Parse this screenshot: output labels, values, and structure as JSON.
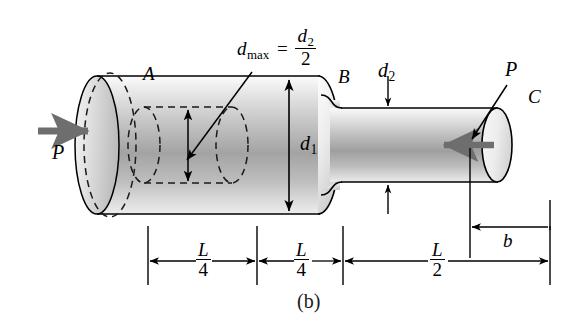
{
  "figure": {
    "caption": "(b)",
    "colors": {
      "line": "#000000",
      "shaft_light": "#f2f2f2",
      "shaft_mid": "#c9c9c9",
      "shaft_dark": "#8f8f8f",
      "end_face": "#e8e8e8",
      "load_arrow": "#6e6e6e",
      "background": "#ffffff"
    }
  },
  "labels": {
    "point_a": "A",
    "point_b": "B",
    "point_c": "C",
    "load_left": "P",
    "load_right": "P",
    "diameter_1": "d",
    "diameter_1_sub": "1",
    "diameter_2": "d",
    "diameter_2_sub": "2",
    "dmax_lhs": "d",
    "dmax_lhs_sub": "max",
    "dmax_equals": "=",
    "dmax_num": "d",
    "dmax_num_sub": "2",
    "dmax_den": "2",
    "dim_b": "b"
  },
  "dimensions": [
    {
      "name": "segment-1",
      "numerator": "L",
      "denominator": "4"
    },
    {
      "name": "segment-2",
      "numerator": "L",
      "denominator": "4"
    },
    {
      "name": "segment-3",
      "numerator": "L",
      "denominator": "2"
    }
  ],
  "annotations": {
    "hole_note": "d_max = d_2 / 2",
    "dim_b_label": "b"
  }
}
